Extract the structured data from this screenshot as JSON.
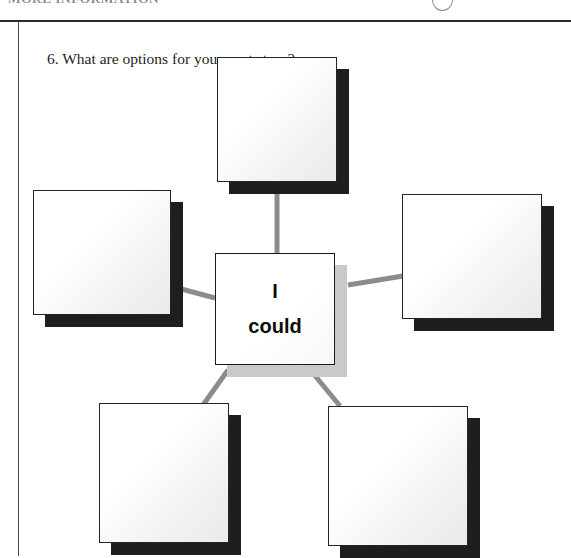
{
  "page": {
    "header_text": "MORE  INFORMATION",
    "header_circle_icon": "circle-outline-icon"
  },
  "question": {
    "number": "6.",
    "text": "6. What are options for your next steps?"
  },
  "diagram": {
    "type": "mind-map",
    "center": {
      "name": "center-node",
      "line1": "I",
      "line2": "could",
      "shadow_color": "#c9c9c9",
      "fill_color": "#ffffff",
      "border_color": "#1a1a1a"
    },
    "branch_count": 5,
    "branches": [
      {
        "name": "option-node-top",
        "position": "top",
        "label": "",
        "shadow_color": "#1e1e1e"
      },
      {
        "name": "option-node-left",
        "position": "left",
        "label": "",
        "shadow_color": "#1e1e1e"
      },
      {
        "name": "option-node-right",
        "position": "right",
        "label": "",
        "shadow_color": "#1e1e1e"
      },
      {
        "name": "option-node-bottom-left",
        "position": "bottom-left",
        "label": "",
        "shadow_color": "#1e1e1e"
      },
      {
        "name": "option-node-bottom-right",
        "position": "bottom-right",
        "label": "",
        "shadow_color": "#1e1e1e"
      }
    ],
    "connector_color": "#8c8c8c"
  }
}
